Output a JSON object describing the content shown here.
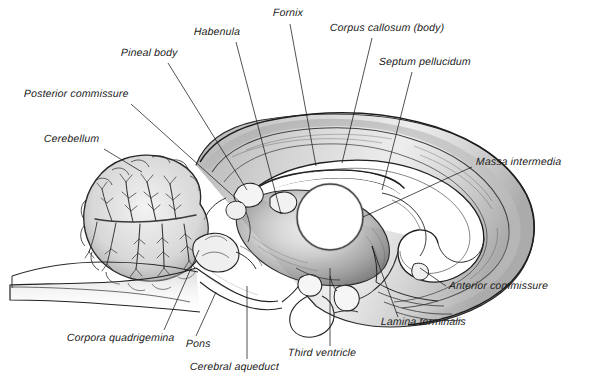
{
  "figure": {
    "type": "anatomical-illustration",
    "style": "pencil / graphite line drawing",
    "background_color": "#ffffff",
    "ink_color": "#1a1a1a",
    "shading_color": "#8a8a8a",
    "width": 593,
    "height": 392
  },
  "labels": [
    {
      "id": "habenula",
      "text": "Habenula",
      "x": 194,
      "y": 32,
      "leader": {
        "x1": 236,
        "y1": 42,
        "x2": 281,
        "y2": 214
      }
    },
    {
      "id": "fornix",
      "text": "Fornix",
      "x": 273,
      "y": 13,
      "leader": {
        "x1": 290,
        "y1": 24,
        "x2": 316,
        "y2": 166
      }
    },
    {
      "id": "corpus-callosum-body",
      "text": "Corpus callosum (body)",
      "x": 330,
      "y": 28,
      "leader": {
        "x1": 372,
        "y1": 38,
        "x2": 342,
        "y2": 163
      }
    },
    {
      "id": "septum-pellucidum",
      "text": "Septum pellucidum",
      "x": 379,
      "y": 62,
      "leader": {
        "x1": 412,
        "y1": 72,
        "x2": 382,
        "y2": 190
      }
    },
    {
      "id": "pineal-body",
      "text": "Pineal body",
      "x": 121,
      "y": 53,
      "leader": {
        "x1": 168,
        "y1": 63,
        "x2": 247,
        "y2": 190
      }
    },
    {
      "id": "posterior-commissure",
      "text": "Posterior commissure",
      "x": 24,
      "y": 94,
      "leader": {
        "x1": 131,
        "y1": 104,
        "x2": 241,
        "y2": 203
      }
    },
    {
      "id": "cerebellum",
      "text": "Cerebellum",
      "x": 44,
      "y": 139,
      "leader": {
        "x1": 104,
        "y1": 149,
        "x2": 142,
        "y2": 172
      }
    },
    {
      "id": "massa-intermedia",
      "text": "Massa intermedia",
      "x": 476,
      "y": 162,
      "leader": {
        "x1": 472,
        "y1": 168,
        "x2": 452,
        "y2": 176
      }
    },
    {
      "id": "anterior-commissure",
      "text": "Anterior commissure",
      "x": 449,
      "y": 285,
      "leader": {
        "x1": 446,
        "y1": 288,
        "x2": 420,
        "y2": 268
      }
    },
    {
      "id": "lamina-terminalis",
      "text": "Lamina terminalis",
      "x": 381,
      "y": 321,
      "leader": {
        "x1": 398,
        "y1": 318,
        "x2": 372,
        "y2": 246
      }
    },
    {
      "id": "third-ventricle",
      "text": "Third ventricle",
      "x": 288,
      "y": 352,
      "leader": {
        "x1": 330,
        "y1": 346,
        "x2": 330,
        "y2": 271
      }
    },
    {
      "id": "cerebral-aqueduct",
      "text": "Cerebral aqueduct",
      "x": 190,
      "y": 366,
      "leader": {
        "x1": 247,
        "y1": 360,
        "x2": 247,
        "y2": 286
      }
    },
    {
      "id": "pons",
      "text": "Pons",
      "x": 186,
      "y": 343,
      "leader": {
        "x1": 196,
        "y1": 337,
        "x2": 216,
        "y2": 292
      }
    },
    {
      "id": "corpora-quadrigemina",
      "text": "Corpora quadrigemina",
      "x": 67,
      "y": 337,
      "leader": {
        "x1": 164,
        "y1": 331,
        "x2": 199,
        "y2": 250
      }
    }
  ],
  "structures": [
    {
      "id": "cerebrum",
      "name": "Cerebrum (cerebral hemisphere, medial surface)"
    },
    {
      "id": "cerebellum-body",
      "name": "Cerebellum with arbor vitae"
    },
    {
      "id": "brainstem",
      "name": "Brainstem / medulla oblongata"
    },
    {
      "id": "corpus-callosum",
      "name": "Corpus callosum arch"
    },
    {
      "id": "thalamus",
      "name": "Thalamus"
    },
    {
      "id": "massa-intermedia-nucleus",
      "name": "Massa intermedia (interthalamic adhesion)"
    },
    {
      "id": "third-ventricle-cavity",
      "name": "Third ventricle cavity"
    },
    {
      "id": "pituitary",
      "name": "Pituitary gland / infundibulum"
    },
    {
      "id": "pons-body",
      "name": "Pons"
    },
    {
      "id": "midbrain",
      "name": "Midbrain with corpora quadrigemina"
    }
  ]
}
